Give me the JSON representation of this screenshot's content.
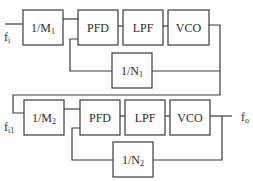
{
  "diagram": {
    "type": "cascaded-pll-block-diagram",
    "stage1": {
      "input_label": "f",
      "input_sub": "i",
      "blocks": {
        "m_divider": {
          "label": "1/M",
          "sub": "1"
        },
        "pfd": {
          "label": "PFD"
        },
        "lpf": {
          "label": "LPF"
        },
        "vco": {
          "label": "VCO"
        },
        "n_divider": {
          "label": "1/N",
          "sub": "1"
        }
      }
    },
    "stage2": {
      "input_label": "f",
      "input_sub": "i1",
      "output_label": "f",
      "output_sub": "o",
      "blocks": {
        "m_divider": {
          "label": "1/M",
          "sub": "2"
        },
        "pfd": {
          "label": "PFD"
        },
        "lpf": {
          "label": "LPF"
        },
        "vco": {
          "label": "VCO"
        },
        "n_divider": {
          "label": "1/N",
          "sub": "2"
        }
      }
    },
    "colors": {
      "line": "#3a3a3a",
      "background": "#ffffff"
    }
  }
}
